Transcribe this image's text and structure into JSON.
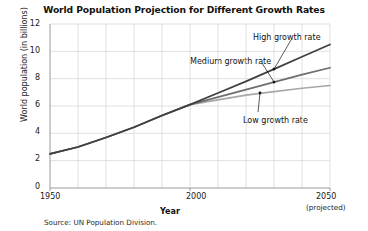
{
  "chart_data": {
    "type": "line",
    "title": "World Population Projection for Different Growth Rates",
    "xlabel": "Year",
    "ylabel": "World population (in billions)",
    "xlim": [
      1950,
      2050
    ],
    "ylim": [
      0,
      12
    ],
    "grid": true,
    "legend_position": "inline-annotations",
    "source_note": "Source: UN Population Division.",
    "yticks": [
      0,
      2,
      4,
      6,
      8,
      10,
      12
    ],
    "ytick_labels": [
      "0",
      "2",
      "4",
      "6",
      "8",
      "10",
      "12"
    ],
    "xticks": [
      1950,
      2000,
      2050
    ],
    "xtick_labels": [
      "1950",
      "2000",
      "2050"
    ],
    "xtick_sublabel": "(projected)",
    "x": [
      1950,
      1960,
      1970,
      1980,
      1990,
      2000,
      2010,
      2020,
      2030,
      2040,
      2050
    ],
    "series": [
      {
        "name": "High growth rate",
        "color": "#3f3f3f",
        "values": [
          2.5,
          3.0,
          3.7,
          4.45,
          5.3,
          6.1,
          6.95,
          7.8,
          8.7,
          9.6,
          10.5
        ]
      },
      {
        "name": "Medium growth rate",
        "color": "#6e6e6e",
        "values": [
          2.5,
          3.0,
          3.7,
          4.45,
          5.3,
          6.1,
          6.65,
          7.2,
          7.75,
          8.3,
          8.8
        ]
      },
      {
        "name": "Low growth rate",
        "color": "#a8a8a8",
        "values": [
          2.5,
          3.0,
          3.7,
          4.45,
          5.3,
          6.1,
          6.45,
          6.8,
          7.05,
          7.3,
          7.5
        ]
      }
    ],
    "annotations": [
      {
        "label": "High growth rate",
        "marker_x": 2030,
        "marker_y": 8.7
      },
      {
        "label": "Medium growth rate",
        "marker_x": 2030,
        "marker_y": 7.75
      },
      {
        "label": "Low growth rate",
        "marker_x": 2025,
        "marker_y": 6.95
      }
    ]
  },
  "colors": {
    "grid": "#d8d8d8",
    "axis": "#9a9a9a",
    "text": "#111111",
    "background": "#ffffff"
  }
}
